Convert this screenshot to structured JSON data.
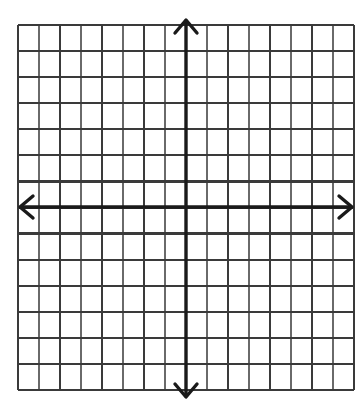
{
  "diagram": {
    "type": "coordinate-grid",
    "grid": {
      "columns": 16,
      "rows": 14,
      "columns_left_of_y_axis": 8,
      "columns_right_of_y_axis": 8,
      "rows_above_x_axis": 7,
      "rows_below_x_axis": 7,
      "bounds_px": {
        "left": 18,
        "top": 25,
        "right": 354,
        "bottom": 390
      },
      "line_color": "#3a3a3a"
    },
    "axes": {
      "x_axis": {
        "y_px": 207,
        "from_x_px": 20,
        "to_x_px": 352,
        "arrows": [
          "left",
          "right"
        ]
      },
      "y_axis": {
        "x_px": 186,
        "from_y_px": 20,
        "to_y_px": 397,
        "arrows": [
          "up",
          "down"
        ]
      },
      "color": "#1a1a1a"
    },
    "labels": [],
    "background_color": "#ffffff"
  }
}
